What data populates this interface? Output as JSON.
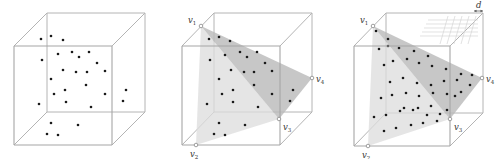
{
  "figure": {
    "panels": [
      {
        "id": "panel-1",
        "cube": {
          "back": [
            [
              47,
              13
            ],
            [
              145,
              13
            ],
            [
              145,
              112
            ],
            [
              47,
              112
            ]
          ],
          "front": [
            [
              14,
              46
            ],
            [
              112,
              46
            ],
            [
              112,
              145
            ],
            [
              14,
              145
            ]
          ]
        },
        "points": [
          [
            41,
            39
          ],
          [
            51,
            36
          ],
          [
            63,
            40
          ],
          [
            42,
            60
          ],
          [
            58,
            54
          ],
          [
            72,
            52
          ],
          [
            79,
            57
          ],
          [
            89,
            52
          ],
          [
            97,
            63
          ],
          [
            105,
            71
          ],
          [
            63,
            70
          ],
          [
            76,
            72
          ],
          [
            87,
            72
          ],
          [
            51,
            79
          ],
          [
            54,
            94
          ],
          [
            65,
            90
          ],
          [
            86,
            85
          ],
          [
            105,
            94
          ],
          [
            126,
            90
          ],
          [
            39,
            104
          ],
          [
            66,
            102
          ],
          [
            91,
            107
          ],
          [
            123,
            101
          ],
          [
            51,
            123
          ],
          [
            78,
            125
          ],
          [
            47,
            134
          ],
          [
            58,
            135
          ]
        ]
      },
      {
        "id": "panel-2",
        "cube": {
          "back": [
            [
              214,
              13
            ],
            [
              312,
              13
            ],
            [
              312,
              112
            ],
            [
              214,
              112
            ]
          ],
          "front": [
            [
              182,
              46
            ],
            [
              280,
              46
            ],
            [
              280,
              145
            ],
            [
              182,
              145
            ]
          ]
        },
        "vertices": {
          "v1": [
            201,
            26
          ],
          "v2": [
            196,
            145
          ],
          "v3": [
            279,
            119
          ],
          "v4": [
            312,
            78
          ]
        },
        "labels": {
          "v1": "v",
          "v1_sub": "1",
          "v2": "v",
          "v2_sub": "2",
          "v3": "v",
          "v3_sub": "3",
          "v4": "v",
          "v4_sub": "4"
        },
        "points": [
          [
            209,
            39
          ],
          [
            219,
            37
          ],
          [
            230,
            41
          ],
          [
            210,
            60
          ],
          [
            225,
            55
          ],
          [
            240,
            52
          ],
          [
            247,
            57
          ],
          [
            257,
            52
          ],
          [
            265,
            63
          ],
          [
            272,
            71
          ],
          [
            231,
            70
          ],
          [
            244,
            72
          ],
          [
            254,
            72
          ],
          [
            219,
            79
          ],
          [
            222,
            94
          ],
          [
            233,
            90
          ],
          [
            254,
            85
          ],
          [
            272,
            94
          ],
          [
            293,
            90
          ],
          [
            207,
            104
          ],
          [
            233,
            102
          ],
          [
            258,
            107
          ],
          [
            290,
            101
          ],
          [
            219,
            123
          ],
          [
            245,
            125
          ],
          [
            214,
            134
          ],
          [
            225,
            135
          ]
        ]
      },
      {
        "id": "panel-3",
        "cube": {
          "back": [
            [
              386,
              13
            ],
            [
              483,
              13
            ],
            [
              483,
              113
            ],
            [
              386,
              113
            ]
          ],
          "front": [
            [
              354,
              46
            ],
            [
              450,
              46
            ],
            [
              450,
              146
            ],
            [
              354,
              146
            ]
          ]
        },
        "vertices": {
          "v1": [
            373,
            26
          ],
          "v2": [
            368,
            146
          ],
          "v3": [
            450,
            119
          ],
          "v4": [
            482,
            78
          ]
        },
        "labels": {
          "v1": "v",
          "v1_sub": "1",
          "v2": "v",
          "v2_sub": "2",
          "v3": "v",
          "v3_sub": "3",
          "v4": "v",
          "v4_sub": "4",
          "d": "d"
        },
        "points": [
          [
            376,
            31
          ],
          [
            388,
            39
          ],
          [
            379,
            49
          ],
          [
            388,
            46
          ],
          [
            399,
            48
          ],
          [
            414,
            51
          ],
          [
            428,
            56
          ],
          [
            384,
            65
          ],
          [
            393,
            61
          ],
          [
            407,
            59
          ],
          [
            419,
            63
          ],
          [
            432,
            66
          ],
          [
            446,
            69
          ],
          [
            461,
            74
          ],
          [
            472,
            75
          ],
          [
            390,
            82
          ],
          [
            403,
            78
          ],
          [
            417,
            83
          ],
          [
            431,
            85
          ],
          [
            444,
            81
          ],
          [
            457,
            80
          ],
          [
            470,
            85
          ],
          [
            381,
            98
          ],
          [
            392,
            95
          ],
          [
            406,
            93
          ],
          [
            419,
            96
          ],
          [
            433,
            93
          ],
          [
            447,
            94
          ],
          [
            461,
            92
          ],
          [
            404,
            108
          ],
          [
            418,
            108
          ],
          [
            431,
            106
          ],
          [
            447,
            110
          ],
          [
            455,
            96
          ],
          [
            374,
            117
          ],
          [
            386,
            115
          ],
          [
            400,
            111
          ],
          [
            413,
            110
          ],
          [
            427,
            115
          ],
          [
            440,
            114
          ],
          [
            384,
            131
          ],
          [
            396,
            128
          ],
          [
            411,
            125
          ],
          [
            423,
            123
          ],
          [
            437,
            121
          ]
        ]
      }
    ],
    "colors": {
      "edge": "#b4b4b4",
      "point": "#1a1a1a",
      "plane_light": "#dcdcdc",
      "plane_dark": "#b9b9b9"
    }
  }
}
